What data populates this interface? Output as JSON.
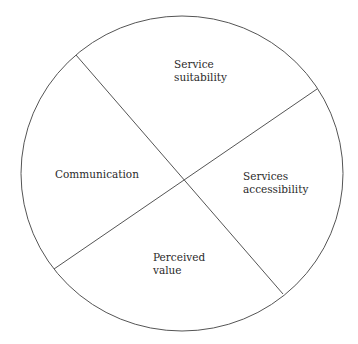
{
  "diagram": {
    "type": "circle divided into four segments by two crossing lines",
    "stroke_color": "#555555",
    "background": "#ffffff",
    "segments": [
      {
        "id": "top",
        "lines": [
          "Service",
          "suitability"
        ]
      },
      {
        "id": "left",
        "lines": [
          "Communication"
        ]
      },
      {
        "id": "right",
        "lines": [
          "Services",
          "accessibility"
        ]
      },
      {
        "id": "bottom",
        "lines": [
          "Perceived",
          "value"
        ]
      }
    ]
  }
}
